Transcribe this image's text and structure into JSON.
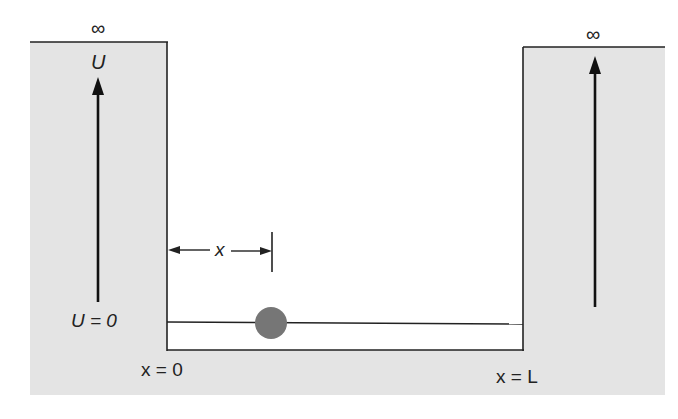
{
  "diagram": {
    "colors": {
      "barrier_fill": "#e4e4e4",
      "line": "#222222",
      "particle": "#767676",
      "background": "#ffffff"
    },
    "labels": {
      "left_infinity": "∞",
      "right_infinity": "∞",
      "potential_axis": "U",
      "zero_potential": "U = 0",
      "left_wall_position": "x = 0",
      "right_wall_position": "x = L",
      "displacement": "x"
    },
    "elements": [
      {
        "id": "left-barrier",
        "kind": "region",
        "potential": "infinite"
      },
      {
        "id": "right-barrier",
        "kind": "region",
        "potential": "infinite"
      },
      {
        "id": "well",
        "kind": "region",
        "potential": "0",
        "from": "x = 0",
        "to": "x = L"
      },
      {
        "id": "particle",
        "kind": "ball",
        "position": "x"
      }
    ]
  }
}
